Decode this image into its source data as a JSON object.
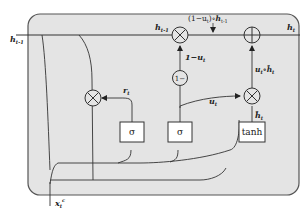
{
  "diagram": {
    "type": "GRU cell",
    "colors": {
      "cell_fill": "#e4e4e4",
      "cell_stroke": "#555555",
      "line": "#333333",
      "box_fill": "#ffffff"
    },
    "inputs": {
      "h_prev": {
        "main": "h",
        "sub": "t-1"
      },
      "x": {
        "main": "x",
        "sub": "t",
        "sup": "c"
      }
    },
    "output": {
      "main": "h",
      "sub": "t"
    },
    "top_annotation": {
      "text": "(1−u",
      "sub": "t",
      "mid": ")∘",
      "h": "h",
      "hsub": "t-1"
    },
    "top_left_label": {
      "main": "h",
      "sub": "t-1"
    },
    "gates": [
      {
        "id": "reset",
        "label": "σ"
      },
      {
        "id": "update",
        "label": "σ"
      },
      {
        "id": "candidate",
        "label": "tanh"
      }
    ],
    "operators": [
      {
        "id": "reset-mult",
        "symbol": "⊗"
      },
      {
        "id": "forget-mult",
        "symbol": "⊗"
      },
      {
        "id": "candidate-mult",
        "symbol": "⊗"
      },
      {
        "id": "sum",
        "symbol": "⊕"
      },
      {
        "id": "one-minus",
        "symbol": "1−"
      }
    ],
    "edge_labels": {
      "r": {
        "main": "r",
        "sub": "t"
      },
      "u": {
        "main": "u",
        "sub": "t"
      },
      "one_minus_u": {
        "main": "1−u",
        "sub": "t"
      },
      "h_tilde": {
        "main": "ĥ",
        "sub": "t"
      },
      "u_h_tilde": {
        "main": "u",
        "sub": "t",
        "mid": "∘",
        "h": "ĥ",
        "hsub": "t"
      }
    }
  }
}
